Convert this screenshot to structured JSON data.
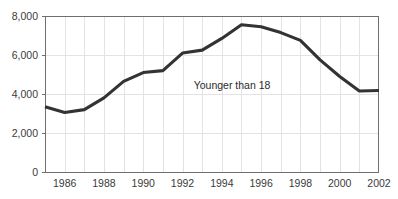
{
  "chart_data": {
    "type": "line",
    "title": "",
    "xlabel": "",
    "ylabel": "",
    "annotation": "Younger than 18",
    "grid": true,
    "legend_position": "none",
    "xlim": [
      1985,
      2002
    ],
    "ylim": [
      0,
      8000
    ],
    "x": [
      1985,
      1986,
      1987,
      1988,
      1989,
      1990,
      1991,
      1992,
      1993,
      1994,
      1995,
      1996,
      1997,
      1998,
      1999,
      2000,
      2001,
      2002
    ],
    "series": [
      {
        "name": "Younger than 18",
        "color": "#333333",
        "values": [
          3350,
          3050,
          3200,
          3800,
          4650,
          5100,
          5200,
          6100,
          6250,
          6850,
          7550,
          7450,
          7150,
          6750,
          5750,
          4900,
          4150,
          4180
        ]
      }
    ],
    "y_ticks": [
      0,
      2000,
      4000,
      6000,
      8000
    ],
    "y_tick_labels": [
      "0",
      "2,000",
      "4,000",
      "6,000",
      "8,000"
    ],
    "x_ticks": [
      1986,
      1988,
      1990,
      1992,
      1994,
      1996,
      1998,
      2000,
      2002
    ],
    "x_tick_labels": [
      "1986",
      "1988",
      "1990",
      "1992",
      "1994",
      "1996",
      "1998",
      "2000",
      "2002"
    ],
    "x_gridlines": [
      1986,
      1987,
      1988,
      1989,
      1990,
      1991,
      1992,
      1993,
      1994,
      1995,
      1996,
      1997,
      1998,
      1999,
      2000,
      2001
    ],
    "colors": {
      "background": "#ffffff",
      "grid": "#e3e3e3",
      "axis": "#6f6f6f",
      "line": "#333333",
      "text": "#3a3a3a"
    }
  }
}
